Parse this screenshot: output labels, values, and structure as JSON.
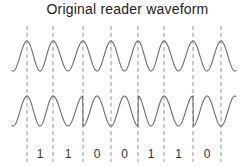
{
  "title": "Original  reader  waveform",
  "colors": {
    "waveform": "#6b6b6b",
    "dashed": "#8a8a8a",
    "text": "#222222"
  },
  "divider_x": [
    27,
    53,
    83,
    111,
    138,
    164,
    193,
    221
  ],
  "bits": [
    "1",
    "1",
    "0",
    "0",
    "1",
    "1",
    "0"
  ],
  "phase_reversals_at_x": [
    83,
    138,
    193
  ]
}
